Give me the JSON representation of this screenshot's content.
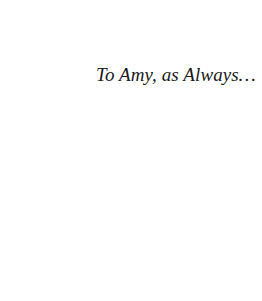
{
  "page": {
    "type": "dedication",
    "dedication_text": "To Amy, as Always…"
  },
  "colors": {
    "background": "#ffffff",
    "text": "#1a1a1a"
  }
}
